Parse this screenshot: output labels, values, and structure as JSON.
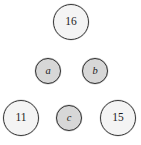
{
  "diagram": {
    "type": "node-diagram",
    "background_color": "#ffffff",
    "width": 141,
    "height": 145,
    "large_node_fill": "#f4f4f4",
    "large_node_stroke": "#3a3a3a",
    "small_node_fill": "#d7d7d7",
    "small_node_stroke": "#303030",
    "text_color": "#1c1c1c",
    "nodes": [
      {
        "id": "node-16",
        "label": "16",
        "kind": "large",
        "style": "numeral",
        "row": "top",
        "cx": 71,
        "cy": 22,
        "r": 18
      },
      {
        "id": "node-a",
        "label": "a",
        "kind": "small",
        "style": "italic-letter",
        "row": "middle",
        "cx": 48,
        "cy": 71,
        "r": 13
      },
      {
        "id": "node-b",
        "label": "b",
        "kind": "small",
        "style": "italic-letter",
        "row": "middle",
        "cx": 95,
        "cy": 71,
        "r": 13
      },
      {
        "id": "node-11",
        "label": "11",
        "kind": "large",
        "style": "numeral",
        "row": "bottom",
        "cx": 21,
        "cy": 118,
        "r": 18
      },
      {
        "id": "node-c",
        "label": "c",
        "kind": "small",
        "style": "italic-letter",
        "row": "bottom",
        "cx": 69,
        "cy": 118,
        "r": 13
      },
      {
        "id": "node-15",
        "label": "15",
        "kind": "large",
        "style": "numeral",
        "row": "bottom",
        "cx": 118,
        "cy": 118,
        "r": 18
      }
    ]
  }
}
